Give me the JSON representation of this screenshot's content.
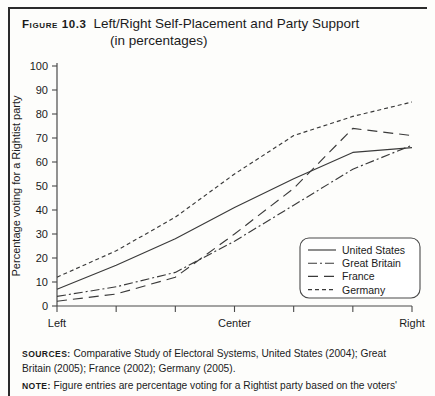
{
  "figure": {
    "label": "Figure 10.3",
    "title": "Left/Right Self-Placement and Party Support",
    "subtitle": "(in percentages)"
  },
  "sources": {
    "label": "Sources:",
    "text": "Comparative Study of Electoral Systems, United States (2004); Great Britain (2005); France (2002); Germany (2005)."
  },
  "note": {
    "label": "Note:",
    "text": "Figure entries are percentage voting for a Rightist party based on the voters'"
  },
  "chart_data": {
    "type": "line",
    "title": "Left/Right Self-Placement and Party Support",
    "subtitle": "(in percentages)",
    "xlabel": "",
    "ylabel": "Percentage voting for a Rightist party",
    "ylim": [
      0,
      100
    ],
    "ytick_labels": [
      "0",
      "10",
      "20",
      "30",
      "40",
      "50",
      "60",
      "70",
      "80",
      "90",
      "100"
    ],
    "ytick_values": [
      0,
      10,
      20,
      30,
      40,
      50,
      60,
      70,
      80,
      90,
      100
    ],
    "xtick_labels": [
      "Left",
      "Center",
      "Right"
    ],
    "xtick_positions": [
      1,
      4,
      7
    ],
    "x": [
      1,
      2,
      3,
      4,
      5,
      6,
      7
    ],
    "grid": false,
    "legend_position": "bottom-right",
    "series": [
      {
        "name": "United States",
        "style": "solid",
        "color": "#3a3a3a",
        "values": [
          7,
          17,
          28,
          41,
          53,
          64,
          66
        ]
      },
      {
        "name": "Great Britain",
        "style": "dash-dot",
        "color": "#3a3a3a",
        "values": [
          4,
          8,
          14,
          27,
          42,
          57,
          67
        ]
      },
      {
        "name": "France",
        "style": "long-dash",
        "color": "#3a3a3a",
        "values": [
          2,
          5,
          12,
          30,
          49,
          74,
          71
        ]
      },
      {
        "name": "Germany",
        "style": "short-dash",
        "color": "#3a3a3a",
        "values": [
          12,
          23,
          37,
          55,
          71,
          79,
          85
        ]
      }
    ]
  }
}
